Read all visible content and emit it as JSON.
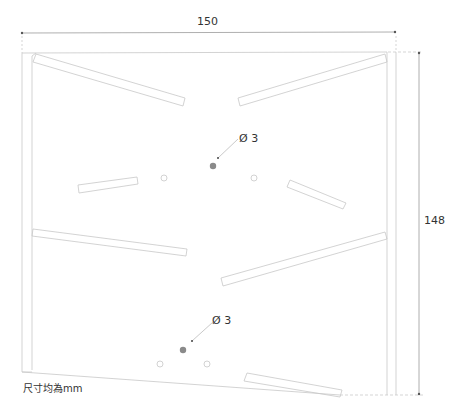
{
  "drawing": {
    "dimensions": {
      "width": "150",
      "height": "148"
    },
    "holes": [
      {
        "label": "Ø 3"
      },
      {
        "label": "Ø 3"
      }
    ],
    "note": "尺寸均為mm",
    "colors": {
      "line": "#c8c8c8",
      "dimension_line": "#9a9a9a",
      "hole_fill": "#8a8a8a",
      "text": "#333333"
    }
  }
}
